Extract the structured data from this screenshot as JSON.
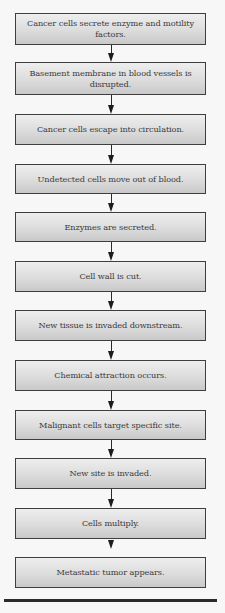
{
  "diagram": {
    "type": "flowchart",
    "direction": "top-to-bottom",
    "steps": [
      {
        "label": "Cancer cells secrete enzyme and motility factors."
      },
      {
        "label": "Basement membrane in blood vessels is disrupted."
      },
      {
        "label": "Cancer cells escape into circulation."
      },
      {
        "label": "Undetected cells move out of blood."
      },
      {
        "label": "Enzymes are secreted."
      },
      {
        "label": "Cell wall is cut."
      },
      {
        "label": "New tissue is invaded downstream."
      },
      {
        "label": "Chemical attraction occurs."
      },
      {
        "label": "Malignant cells target specific site."
      },
      {
        "label": "New site is invaded."
      },
      {
        "label": "Cells multiply."
      },
      {
        "label": "Metastatic tumor appears."
      }
    ],
    "edges": [
      {
        "from": 0,
        "to": 1
      },
      {
        "from": 1,
        "to": 2
      },
      {
        "from": 2,
        "to": 3
      },
      {
        "from": 3,
        "to": 4
      },
      {
        "from": 4,
        "to": 5
      },
      {
        "from": 5,
        "to": 6
      },
      {
        "from": 6,
        "to": 7
      },
      {
        "from": 7,
        "to": 8
      },
      {
        "from": 8,
        "to": 9
      },
      {
        "from": 9,
        "to": 10
      },
      {
        "from": 10,
        "to": 11
      }
    ],
    "colors": {
      "background": "#f7f7f7",
      "box_border": "#3e3e3e",
      "box_fill_top": "#eeeeee",
      "box_fill_bottom": "#c9c9c9",
      "text": "#3a3a3a",
      "arrow": "#1c1c1c",
      "rule": "#2a2a2a"
    }
  }
}
